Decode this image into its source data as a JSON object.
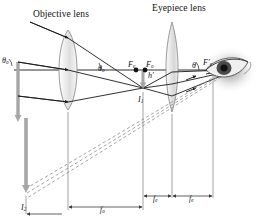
{
  "figure": {
    "kind": "refracting-telescope-ray-diagram",
    "background": "#ffffff",
    "ink": "#1a1a1a",
    "object_color": "#9a9a9a",
    "dash_color": "#8d8d8d"
  },
  "titles": {
    "objective": "Objective lens",
    "eyepiece": "Eyepiece lens"
  },
  "labels": {
    "theta_o_left": "θ",
    "theta_o_left_sub": "o",
    "theta_o_axis": "θ",
    "theta_o_axis_sub": "o",
    "F_e": "F",
    "F_e_sub": "e",
    "F_o": "F",
    "F_o_sub": "o",
    "F_e_prime": "F′",
    "F_e_prime_sub": "e",
    "theta_eye": "θ",
    "h_prime": "h′",
    "I1": "I",
    "I1_sub": "1",
    "I2": "I",
    "I2_sub": "2"
  },
  "dimensions": [
    {
      "name": "f_o",
      "symbol": "f",
      "subscript": "o",
      "span": "objective-lens-to-common-focus"
    },
    {
      "name": "f_e_left",
      "symbol": "f",
      "subscript": "e",
      "span": "common-focus-to-eyepiece"
    },
    {
      "name": "f_e_right",
      "symbol": "f",
      "subscript": "e",
      "span": "eyepiece-to-eye-focal-point"
    }
  ],
  "optics": {
    "axis_y": 70,
    "objective_lens_x": 68,
    "eyepiece_lens_x": 172,
    "common_focal_point_x": 143,
    "eye_x": 228,
    "final_image_I2_x": 26,
    "final_image_I2_y": 196,
    "intermediate_image_I1_x": 143,
    "intermediate_image_I1_y": 88
  }
}
